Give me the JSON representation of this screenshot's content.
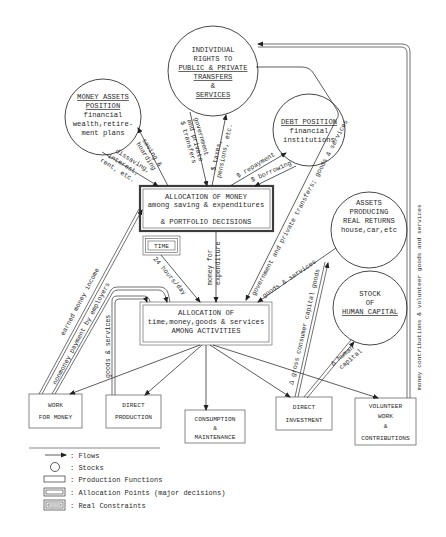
{
  "diagram": {
    "stocks": {
      "money_assets": {
        "title": [
          "MONEY ASSETS",
          "POSITION"
        ],
        "lines": [
          "financial",
          "wealth,retire-",
          "ment plans"
        ]
      },
      "individual_rights": {
        "lines": [
          "INDIVIDUAL",
          "RIGHTS TO"
        ],
        "underlined": [
          "PUBLIC & PRIVATE",
          "TRANSFERS"
        ],
        "amp": "&",
        "services": "SERVICES"
      },
      "debt_position": {
        "title": "DEBT POSITION",
        "lines": [
          "financial",
          "institutions"
        ]
      },
      "assets_real_returns": {
        "lines": [
          "ASSETS",
          "PRODUCING",
          "REAL RETURNS"
        ],
        "examples": "house,car,etc"
      },
      "human_capital": {
        "lines": [
          "STOCK",
          "OF"
        ],
        "title": "HUMAN CAPITAL"
      }
    },
    "allocation_points": {
      "money": {
        "lines": [
          "ALLOCATION OF MONEY",
          "among saving & expenditures",
          "& PORTFOLIO DECISIONS"
        ]
      },
      "activities": {
        "lines": [
          "ALLOCATION OF",
          "time,money,goods & services",
          "AMONG ACTIVITIES"
        ]
      }
    },
    "constraint": {
      "label": "TIME"
    },
    "production_functions": [
      {
        "id": "work",
        "lines": [
          "WORK",
          "FOR MONEY"
        ]
      },
      {
        "id": "direct-production",
        "lines": [
          "DIRECT",
          "PRODUCTION"
        ]
      },
      {
        "id": "consumption",
        "lines": [
          "CONSUMPTION",
          "&",
          "MAINTENANCE"
        ]
      },
      {
        "id": "direct-investment",
        "lines": [
          "DIRECT",
          "INVESTMENT"
        ]
      },
      {
        "id": "volunteer",
        "lines": [
          "VOLUNTEER",
          "WORK",
          "&",
          "CONTRIBUTIONS"
        ]
      }
    ],
    "flow_labels": {
      "saving_hoarding": [
        "saving &",
        "hoarding"
      ],
      "dissaving": [
        "dissaving,",
        "interest,",
        "rent, etc."
      ],
      "gov_private_transfers": [
        "government",
        "and private",
        "$ transfers"
      ],
      "taxes_pensions": [
        "$ taxes,",
        "pensions, etc."
      ],
      "repayment": "$ repayment",
      "borrowing": "$ borrowing",
      "gov_private_goods": "government and private transfers; goods & services",
      "goods_services_assets": "goods & services",
      "money_for_expenditure": [
        "money for",
        "expenditure"
      ],
      "hours_day": "24 hours/day",
      "earned_income": "earned money income",
      "nonmoney_payment": "nonmoney payment by employers",
      "goods_services_dp": "goods & services",
      "consumer_capital_goods": "Δ gross consumer capital goods",
      "human_capital_flow": [
        "Δ human",
        "capital"
      ],
      "money_contributions": "money contributions & volunteer goods and services"
    },
    "legend": [
      {
        "symbol": "arrow",
        "label": ": Flows"
      },
      {
        "symbol": "circle",
        "label": ": Stocks"
      },
      {
        "symbol": "single-box",
        "label": ": Production Functions"
      },
      {
        "symbol": "double-box",
        "label": ": Allocation Points (major decisions)"
      },
      {
        "symbol": "triple-box",
        "label": ": Real Constraints"
      }
    ]
  }
}
